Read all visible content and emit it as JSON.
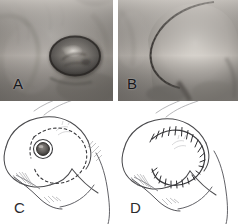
{
  "figure": {
    "type": "medical-surgical-figure",
    "layout": "2x2",
    "background_color": "#ffffff",
    "panels": [
      {
        "id": "A",
        "label": "A",
        "kind": "photograph",
        "tone": "grayscale",
        "caption_text": "A",
        "content_description": "Clinical photograph of an oval ulcerated lesion on skin",
        "position": {
          "x": 0,
          "y": 0,
          "width": 113,
          "height": 101
        },
        "label_position": {
          "x": 13,
          "y": 76
        },
        "colors": {
          "skin_light": "#b9b5b0",
          "skin_mid": "#9a958f",
          "skin_dark": "#6e6a66",
          "lesion_rim": "#3a3632",
          "lesion_body": "#5d5954",
          "lesion_highlight": "#cfcac4"
        }
      },
      {
        "id": "B",
        "label": "B",
        "kind": "photograph",
        "tone": "grayscale",
        "caption_text": "B",
        "content_description": "Clinical photograph of the rotated flap closure with curved suture line",
        "position": {
          "x": 118,
          "y": 0,
          "width": 120,
          "height": 101
        },
        "label_position": {
          "x": 127,
          "y": 76
        },
        "colors": {
          "skin_light": "#cac6c1",
          "skin_mid": "#a8a39e",
          "skin_dark": "#7b7772",
          "suture_line": "#3c3935"
        }
      },
      {
        "id": "C",
        "label": "C",
        "kind": "line-drawing",
        "tone": "pencil",
        "caption_text": "C",
        "content_description": "Schematic of lesion with circular excision margin and dashed planned rotation-flap incision",
        "position": {
          "x": 0,
          "y": 101,
          "width": 116,
          "height": 123
        },
        "label_position": {
          "x": 14,
          "y": 200
        },
        "colors": {
          "outline": "#4a4a4d",
          "dashed_incision": "#3a3a3d",
          "lesion_fill": "#6d6a66",
          "shading": "#a9a7a4"
        }
      },
      {
        "id": "D",
        "label": "D",
        "kind": "line-drawing",
        "tone": "pencil",
        "caption_text": "D",
        "content_description": "Schematic of the completed closure with interrupted suture marks along the curved incision",
        "position": {
          "x": 116,
          "y": 101,
          "width": 122,
          "height": 123
        },
        "label_position": {
          "x": 130,
          "y": 200
        },
        "colors": {
          "outline": "#4a4a4d",
          "suture_line": "#3a3a3d",
          "suture_ticks": "#2f2f32",
          "shading": "#a9a7a4"
        }
      }
    ]
  }
}
